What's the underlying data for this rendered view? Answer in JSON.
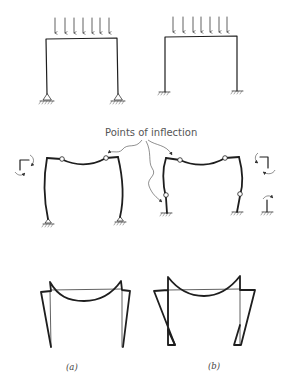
{
  "figure": {
    "annotation": "Points of inflection",
    "captions": {
      "a": "(a)",
      "b": "(b)"
    },
    "panels": [
      {
        "id": "a",
        "support": "pinned",
        "load": "uniformly distributed (7 arrows)",
        "inflection_points": 2
      },
      {
        "id": "b",
        "support": "fixed",
        "load": "uniformly distributed (7 arrows)",
        "inflection_points": 4
      }
    ],
    "rows": [
      "loaded frames",
      "deflected shapes",
      "moment diagrams"
    ],
    "colors": {
      "line": "#1e1e1e",
      "text": "#555555",
      "background": "#ffffff"
    }
  }
}
